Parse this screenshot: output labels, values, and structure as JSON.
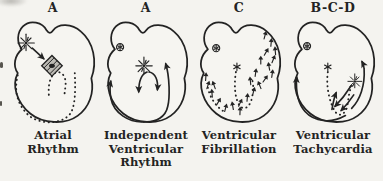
{
  "figure": {
    "colors": {
      "ink": "#232323",
      "paper": "#f4f3ef"
    },
    "panels": [
      {
        "id": "atrial-rhythm",
        "letter": "A",
        "caption_lines": [
          "Atrial",
          "Rhythm"
        ],
        "elements": [
          "heart-outline",
          "sa-node-starburst",
          "conduction-arrow",
          "blocked-av-node-hatched-diamond",
          "dotted-ventricular-path"
        ]
      },
      {
        "id": "independent-ventricular-rhythm",
        "letter": "A",
        "caption_lines": [
          "Independent",
          "Ventricular",
          "Rhythm"
        ],
        "elements": [
          "heart-outline",
          "inactive-sa-node-icon",
          "ventricular-focus-starburst",
          "activation-arrows"
        ]
      },
      {
        "id": "ventricular-fibrillation",
        "letter": "C",
        "caption_lines": [
          "Ventricular",
          "Fibrillation"
        ],
        "elements": [
          "heart-outline",
          "inactive-sa-node-icon",
          "av-junction-asterisk",
          "dotted-conduction-path",
          "chaotic-fibrillation-arrows"
        ]
      },
      {
        "id": "ventricular-tachycardia",
        "letter": "B-C-D",
        "caption_lines": [
          "Ventricular",
          "Tachycardia"
        ],
        "elements": [
          "heart-outline",
          "inactive-sa-node-icon",
          "av-junction-asterisk",
          "dotted-conduction-path",
          "ectopic-focus-starburst",
          "reentry-arrows"
        ]
      }
    ]
  }
}
